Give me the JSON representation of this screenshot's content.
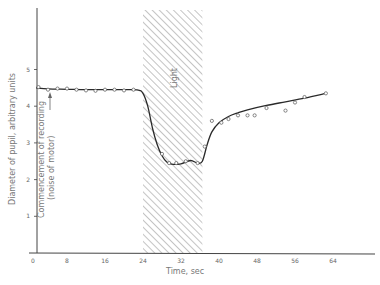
{
  "chart_data": {
    "type": "line",
    "title": "",
    "xlabel": "Time,    sec",
    "ylabel": "Diameter of pupil,   arbitrary units",
    "xlim": [
      0,
      70
    ],
    "ylim": [
      0,
      6
    ],
    "x_ticks": [
      0,
      8,
      16,
      24,
      32,
      40,
      48,
      56,
      64
    ],
    "x_tick_labels": [
      "0",
      "8",
      "16",
      "24",
      "32",
      "40",
      "48",
      "56",
      "64"
    ],
    "y_ticks": [
      1,
      2,
      3,
      4,
      5
    ],
    "y_tick_labels": [
      "1",
      "2",
      "3",
      "4",
      "5"
    ],
    "grid": false,
    "legend": null,
    "shaded_region": {
      "label": "Light",
      "x_start": 24,
      "x_end": 36.5,
      "pattern": "diagonal-hatch"
    },
    "annotations": [
      {
        "text": "Commencement of recording",
        "x": 1.5,
        "y": 4.5,
        "orientation": "vertical"
      },
      {
        "text": "(noise of motor)",
        "x": 1.5,
        "y": 4.5,
        "orientation": "vertical"
      }
    ],
    "series": [
      {
        "name": "Fitted curve",
        "style": "solid-line",
        "x": [
          1.5,
          4,
          8,
          12,
          16,
          20,
          23,
          24,
          25,
          26,
          27,
          28,
          29,
          30,
          32,
          34,
          35.5,
          36.5,
          37.5,
          38.5,
          40,
          42,
          44,
          46,
          50,
          54,
          58,
          62.5
        ],
        "y": [
          4.5,
          4.47,
          4.46,
          4.45,
          4.45,
          4.45,
          4.44,
          4.35,
          4.0,
          3.4,
          2.95,
          2.65,
          2.48,
          2.42,
          2.43,
          2.52,
          2.45,
          2.5,
          2.95,
          3.3,
          3.55,
          3.72,
          3.82,
          3.9,
          4.02,
          4.12,
          4.22,
          4.35
        ]
      },
      {
        "name": "Observed points",
        "style": "open-circles",
        "x": [
          2,
          4,
          6,
          8,
          10,
          12,
          14,
          16,
          18,
          20,
          22,
          28,
          29.5,
          31,
          33,
          35.5,
          37,
          38.5,
          40.5,
          42,
          44,
          46,
          47.5,
          50,
          54,
          56,
          58,
          62.5
        ],
        "y": [
          4.52,
          4.45,
          4.48,
          4.48,
          4.45,
          4.43,
          4.42,
          4.45,
          4.45,
          4.43,
          4.45,
          2.7,
          2.45,
          2.45,
          2.5,
          2.45,
          2.9,
          3.6,
          3.55,
          3.65,
          3.75,
          3.75,
          3.75,
          3.95,
          3.88,
          4.1,
          4.25,
          4.35
        ]
      }
    ]
  },
  "labels": {
    "light": "Light",
    "annotation_line1": "Commencement of recording",
    "annotation_line2": "(noise of motor)",
    "xlabel": "Time,    sec",
    "ylabel": "Diameter of pupil,   arbitrary units"
  }
}
